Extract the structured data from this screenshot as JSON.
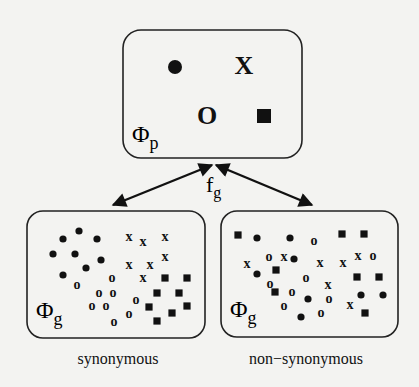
{
  "diagram": {
    "colors": {
      "ink": "#111111",
      "background": "#f3f3f1"
    },
    "phenotype_space": {
      "label": "Φ",
      "subscript": "p",
      "box": {
        "x": 123,
        "y": 30,
        "w": 179,
        "h": 128,
        "r": 18
      },
      "symbols": [
        {
          "type": "dot",
          "x": 175,
          "y": 67
        },
        {
          "type": "x",
          "x": 244,
          "y": 66
        },
        {
          "type": "o",
          "x": 207,
          "y": 116
        },
        {
          "type": "square",
          "x": 264,
          "y": 116
        }
      ]
    },
    "mapping": {
      "label": "f",
      "subscript": "g",
      "arrows": [
        {
          "x1": 212,
          "y1": 165,
          "x2": 113,
          "y2": 205
        },
        {
          "x1": 216,
          "y1": 165,
          "x2": 312,
          "y2": 205
        }
      ]
    },
    "genotype_spaces": [
      {
        "label": "Φ",
        "subscript": "g",
        "caption": "synonymous",
        "caption_x": 118,
        "box": {
          "x": 27,
          "y": 211,
          "w": 178,
          "h": 127,
          "r": 16
        },
        "symbols": [
          {
            "type": "dot",
            "x": 79,
            "y": 231
          },
          {
            "type": "dot",
            "x": 63,
            "y": 239
          },
          {
            "type": "dot",
            "x": 97,
            "y": 239
          },
          {
            "type": "dot",
            "x": 53,
            "y": 254
          },
          {
            "type": "dot",
            "x": 75,
            "y": 254
          },
          {
            "type": "dot",
            "x": 101,
            "y": 260
          },
          {
            "type": "dot",
            "x": 86,
            "y": 268
          },
          {
            "type": "dot",
            "x": 63,
            "y": 275
          },
          {
            "type": "x",
            "x": 129,
            "y": 236
          },
          {
            "type": "x",
            "x": 143,
            "y": 241
          },
          {
            "type": "x",
            "x": 165,
            "y": 236
          },
          {
            "type": "x",
            "x": 165,
            "y": 256
          },
          {
            "type": "x",
            "x": 129,
            "y": 264
          },
          {
            "type": "x",
            "x": 150,
            "y": 264
          },
          {
            "type": "x",
            "x": 143,
            "y": 277
          },
          {
            "type": "o",
            "x": 77,
            "y": 284
          },
          {
            "type": "o",
            "x": 112,
            "y": 277
          },
          {
            "type": "o",
            "x": 99,
            "y": 292
          },
          {
            "type": "o",
            "x": 113,
            "y": 292
          },
          {
            "type": "o",
            "x": 92,
            "y": 305
          },
          {
            "type": "o",
            "x": 106,
            "y": 305
          },
          {
            "type": "o",
            "x": 136,
            "y": 299
          },
          {
            "type": "o",
            "x": 129,
            "y": 313
          },
          {
            "type": "o",
            "x": 114,
            "y": 321
          },
          {
            "type": "square",
            "x": 165,
            "y": 278
          },
          {
            "type": "square",
            "x": 187,
            "y": 278
          },
          {
            "type": "square",
            "x": 157,
            "y": 293
          },
          {
            "type": "square",
            "x": 179,
            "y": 293
          },
          {
            "type": "square",
            "x": 149,
            "y": 307
          },
          {
            "type": "square",
            "x": 187,
            "y": 306
          },
          {
            "type": "square",
            "x": 172,
            "y": 313
          },
          {
            "type": "square",
            "x": 157,
            "y": 321
          }
        ]
      },
      {
        "label": "Φ",
        "subscript": "g",
        "caption": "non−synonymous",
        "caption_x": 306,
        "box": {
          "x": 221,
          "y": 211,
          "w": 177,
          "h": 126,
          "r": 16
        },
        "symbols": [
          {
            "type": "square",
            "x": 238,
            "y": 235
          },
          {
            "type": "dot",
            "x": 257,
            "y": 238
          },
          {
            "type": "dot",
            "x": 290,
            "y": 238
          },
          {
            "type": "o",
            "x": 314,
            "y": 240
          },
          {
            "type": "square",
            "x": 342,
            "y": 234
          },
          {
            "type": "square",
            "x": 364,
            "y": 234
          },
          {
            "type": "o",
            "x": 269,
            "y": 256
          },
          {
            "type": "x",
            "x": 284,
            "y": 256
          },
          {
            "type": "dot",
            "x": 294,
            "y": 259
          },
          {
            "type": "x",
            "x": 247,
            "y": 263
          },
          {
            "type": "x",
            "x": 320,
            "y": 262
          },
          {
            "type": "x",
            "x": 343,
            "y": 262
          },
          {
            "type": "x",
            "x": 358,
            "y": 255
          },
          {
            "type": "o",
            "x": 373,
            "y": 255
          },
          {
            "type": "dot",
            "x": 257,
            "y": 274
          },
          {
            "type": "square",
            "x": 276,
            "y": 270
          },
          {
            "type": "o",
            "x": 306,
            "y": 277
          },
          {
            "type": "square",
            "x": 357,
            "y": 277
          },
          {
            "type": "square",
            "x": 379,
            "y": 277
          },
          {
            "type": "o",
            "x": 270,
            "y": 283
          },
          {
            "type": "square",
            "x": 275,
            "y": 292
          },
          {
            "type": "o",
            "x": 292,
            "y": 291
          },
          {
            "type": "x",
            "x": 328,
            "y": 284
          },
          {
            "type": "dot",
            "x": 308,
            "y": 299
          },
          {
            "type": "o",
            "x": 329,
            "y": 298
          },
          {
            "type": "o",
            "x": 284,
            "y": 305
          },
          {
            "type": "dot",
            "x": 301,
            "y": 317
          },
          {
            "type": "o",
            "x": 321,
            "y": 312
          },
          {
            "type": "x",
            "x": 350,
            "y": 304
          },
          {
            "type": "dot",
            "x": 361,
            "y": 295
          },
          {
            "type": "dot",
            "x": 383,
            "y": 295
          },
          {
            "type": "square",
            "x": 365,
            "y": 313
          }
        ]
      }
    ]
  }
}
